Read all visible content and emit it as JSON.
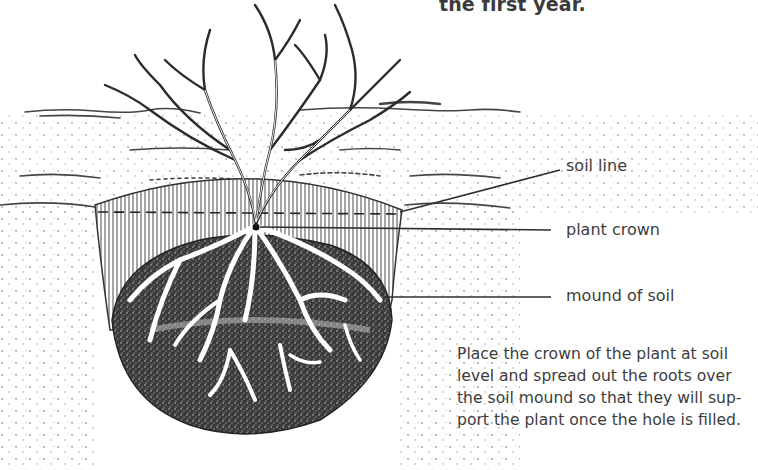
{
  "page": {
    "heading_tail": "the first year."
  },
  "figure": {
    "labels": [
      {
        "id": "soil-line",
        "text": "soil line"
      },
      {
        "id": "plant-crown",
        "text": "plant crown"
      },
      {
        "id": "mound-of-soil",
        "text": "mound of soil"
      }
    ],
    "caption_lines": [
      "Place the crown of the plant at soil",
      "level and spread out the roots over",
      "the soil mound so that they will sup-",
      "port the plant once the hole is filled."
    ],
    "colors": {
      "ink": "#2b2b2b",
      "text": "#3d3d3d",
      "background": "#ffffff"
    }
  }
}
